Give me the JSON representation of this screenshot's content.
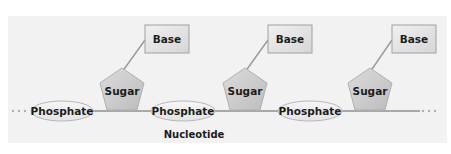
{
  "diagram": {
    "colors": {
      "panel_background": "#f2f2f2",
      "backbone": "#a8a8a8",
      "connector": "#9a9a9a",
      "phosphate_fill": "#efefef",
      "phosphate_stroke": "#b8b8b8",
      "sugar_fill": "#cfcfcf",
      "sugar_stroke": "#b0b0b0",
      "base_fill": "#e4e4e4",
      "base_stroke": "#a0a0a0",
      "text": "#1c1c1c"
    },
    "units": [
      {
        "phosphate_label": "Phosphate",
        "sugar_label": "Sugar",
        "base_label": "Base"
      },
      {
        "phosphate_label": "Phosphate",
        "sugar_label": "Sugar",
        "base_label": "Base"
      },
      {
        "phosphate_label": "Phosphate",
        "sugar_label": "Sugar",
        "base_label": "Base"
      }
    ],
    "nucleotide_label": "Nucleotide",
    "continuation_left": "...",
    "continuation_right": "..."
  }
}
